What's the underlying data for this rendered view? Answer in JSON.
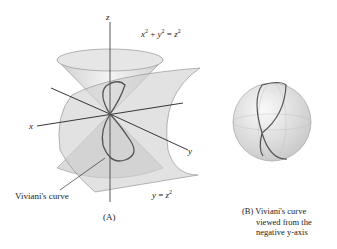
{
  "figure_a": {
    "axis_labels": {
      "x": "x",
      "y": "y",
      "z": "z"
    },
    "cone_equation": {
      "lhs_a": "x",
      "plus": " + ",
      "lhs_b": "y",
      "eq": " = ",
      "rhs": "z",
      "exp": "2"
    },
    "cylinder_equation": {
      "lhs": "y",
      "eq": " = ",
      "rhs": "z",
      "exp": "2"
    },
    "curve_label": "Viviani's curve",
    "caption": "(A)"
  },
  "figure_b": {
    "caption_tag": "(B)",
    "caption_lines": [
      "Viviani's curve",
      "viewed from the",
      "negative y-axis"
    ]
  },
  "colors": {
    "surface": "#d9d9d9",
    "surface_dark": "#bdbdbd",
    "curve": "#555555",
    "axis": "#222222"
  }
}
